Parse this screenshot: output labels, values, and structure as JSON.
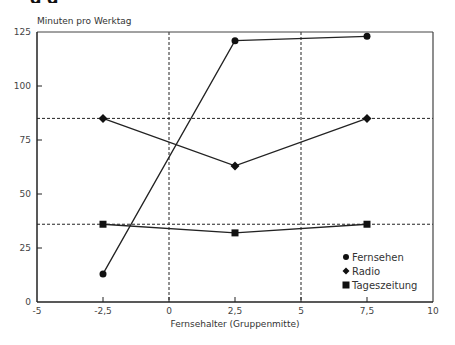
{
  "chart_data": {
    "type": "line",
    "title": "",
    "ylabel": "Minuten pro Werktag",
    "xlabel": "Fernsehalter (Gruppenmitte)",
    "xlim": [
      -5,
      10
    ],
    "ylim": [
      0,
      125
    ],
    "x_ticks": [
      "-5",
      "-2,5",
      "0",
      "2,5",
      "5",
      "7,5",
      "10"
    ],
    "x_tick_values": [
      -5,
      -2.5,
      0,
      2.5,
      5,
      7.5,
      10
    ],
    "y_ticks": [
      "0",
      "25",
      "50",
      "75",
      "100",
      "125"
    ],
    "y_tick_values": [
      0,
      25,
      50,
      75,
      100,
      125
    ],
    "x": [
      -2.5,
      2.5,
      7.5
    ],
    "series": [
      {
        "name": "Fernsehen",
        "marker": "circle",
        "values": [
          13,
          121,
          123
        ]
      },
      {
        "name": "Radio",
        "marker": "diamond",
        "values": [
          85,
          63,
          85
        ]
      },
      {
        "name": "Tageszeitung",
        "marker": "square",
        "values": [
          36,
          32,
          36
        ]
      }
    ],
    "reference_lines": {
      "horizontal": [
        85,
        36
      ],
      "vertical": [
        0,
        5
      ],
      "style": "dashed"
    },
    "grid": false,
    "legend_position": "lower right inside"
  },
  "header": {
    "clipped_title_text": "g                                                                                g"
  }
}
